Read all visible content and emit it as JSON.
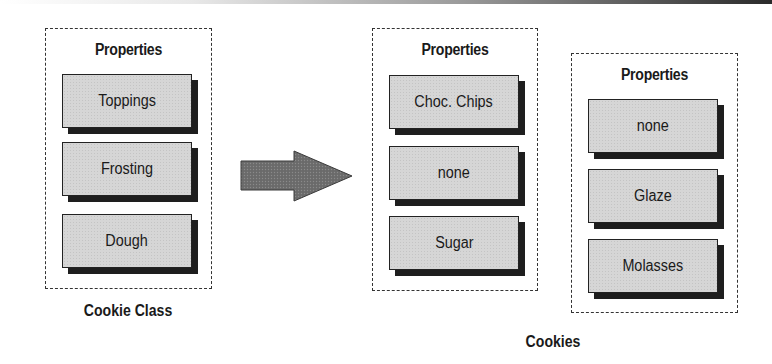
{
  "diagram": {
    "class_group": {
      "title": "Properties",
      "caption": "Cookie Class",
      "properties": [
        "Toppings",
        "Frosting",
        "Dough"
      ]
    },
    "arrow": {
      "direction": "right",
      "meaning": "instantiation"
    },
    "instances": {
      "caption": "Cookies",
      "objects": [
        {
          "title": "Properties",
          "properties": [
            "Choc. Chips",
            "none",
            "Sugar"
          ]
        },
        {
          "title": "Properties",
          "properties": [
            "none",
            "Glaze",
            "Molasses"
          ]
        }
      ]
    },
    "colors": {
      "property_fill": "#d6d6d6",
      "shadow": "#1e1e1e",
      "arrow_fill": "#6a6a6a",
      "dashed_border": "#333333"
    }
  }
}
